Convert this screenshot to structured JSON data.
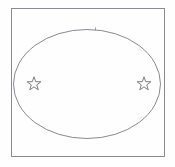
{
  "figure": {
    "title": "Ellipse inscribed in rectangle with two stars",
    "canvas": {
      "width": 175,
      "height": 167,
      "background_color": "#fefefe"
    },
    "shapes": {
      "frame": {
        "name": "rectangle-frame",
        "label": "Rectangle frame",
        "x": 11.5,
        "y": 8.5,
        "width": 153,
        "height": 148,
        "stroke_color": "#8a8a92",
        "stroke_width": 1,
        "fill": "none"
      },
      "ellipse": {
        "name": "ellipse-outline",
        "label": "Ellipse",
        "cx": 87,
        "cy": 84,
        "rx": 73.5,
        "ry": 54.5,
        "stroke_color": "#8a8a92",
        "stroke_width": 1,
        "fill": "none"
      },
      "tick_mark": {
        "name": "top-tick-mark",
        "label": "Tick mark at ellipse apex",
        "x": 95.5,
        "y_top": 27.5,
        "y_bottom": 30.5,
        "stroke_color": "#9a9aa2",
        "stroke_width": 1
      },
      "stars": [
        {
          "name": "star-left",
          "label": "Left star",
          "cx": 34,
          "cy": 84,
          "radius": 7.2,
          "points": 5,
          "stroke_color": "#6f6f78",
          "stroke_width": 0.9,
          "fill": "none"
        },
        {
          "name": "star-right",
          "label": "Right star",
          "cx": 144,
          "cy": 84,
          "radius": 7.2,
          "points": 5,
          "stroke_color": "#6f6f78",
          "stroke_width": 0.9,
          "fill": "none"
        }
      ]
    }
  }
}
